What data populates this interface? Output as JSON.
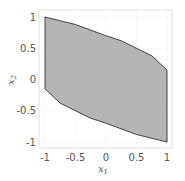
{
  "chart_data": {
    "type": "area",
    "title": "",
    "xlabel": "x1",
    "ylabel": "x2",
    "xlim": [
      -1.1,
      1.1
    ],
    "ylim": [
      -1.1,
      1.1
    ],
    "grid": true,
    "xticks": [
      "-1",
      "-0.5",
      "0",
      "0.5",
      "1"
    ],
    "yticks": [
      "-1",
      "-0.5",
      "0",
      "0.5",
      "1"
    ],
    "series": [
      {
        "name": "feasible region",
        "fill": "#b4b4b4",
        "stroke": "#333333",
        "polygon": [
          [
            -1,
            1
          ],
          [
            -0.5,
            0.88
          ],
          [
            0,
            0.7
          ],
          [
            0.25,
            0.62
          ],
          [
            0.75,
            0.38
          ],
          [
            1,
            0.15
          ],
          [
            1,
            -1
          ],
          [
            0.5,
            -0.88
          ],
          [
            0,
            -0.7
          ],
          [
            -0.25,
            -0.62
          ],
          [
            -0.75,
            -0.38
          ],
          [
            -1,
            -0.15
          ]
        ]
      }
    ]
  },
  "axes": {
    "xlabel_main": "x",
    "xlabel_sub": "1",
    "ylabel_main": "x",
    "ylabel_sub": "2"
  }
}
